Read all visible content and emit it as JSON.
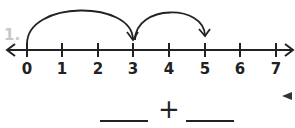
{
  "question": {
    "number_label": "1.",
    "number_line": {
      "min": 0,
      "max": 7,
      "ticks": [
        "0",
        "1",
        "2",
        "3",
        "4",
        "5",
        "6",
        "7"
      ],
      "jumps": [
        {
          "from": 0,
          "to": 3
        },
        {
          "from": 3,
          "to": 5
        }
      ]
    },
    "equation": {
      "blank1": "",
      "operator": "+",
      "blank2": ""
    }
  },
  "colors": {
    "line": "#222222",
    "number_label": "#c8c8c8"
  }
}
